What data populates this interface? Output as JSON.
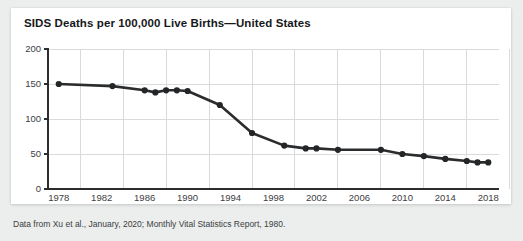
{
  "card": {
    "title": "SIDS Deaths per 100,000 Live Births—United States",
    "footnote": "Data from Xu et al., January, 2020; Monthly Vital Statistics Report, 1980."
  },
  "chart_data": {
    "type": "line",
    "title": "SIDS Deaths per 100,000 Live Births—United States",
    "xlabel": "Year",
    "ylabel": "",
    "xlim": [
      1977,
      2019
    ],
    "ylim": [
      0,
      200
    ],
    "xticks": [
      1978,
      1982,
      1986,
      1990,
      1994,
      1998,
      2002,
      2006,
      2010,
      2014,
      2018
    ],
    "yticks": [
      0,
      50,
      100,
      150,
      200
    ],
    "grid": true,
    "legend": "none",
    "line_color": "#2a2c2e",
    "marker_color": "#232527",
    "x": [
      1978,
      1983,
      1986,
      1987,
      1988,
      1989,
      1990,
      1993,
      1996,
      1999,
      2001,
      2002,
      2004,
      2008,
      2010,
      2012,
      2014,
      2016,
      2017,
      2018
    ],
    "values": [
      150,
      147,
      141,
      138,
      141,
      141,
      140,
      120,
      80,
      62,
      58,
      58,
      56,
      56,
      50,
      47,
      43,
      40,
      38,
      38
    ],
    "series": [
      {
        "name": "SIDS deaths per 100,000 live births",
        "x": [
          1978,
          1983,
          1986,
          1987,
          1988,
          1989,
          1990,
          1993,
          1996,
          1999,
          2001,
          2002,
          2004,
          2008,
          2010,
          2012,
          2014,
          2016,
          2017,
          2018
        ],
        "values": [
          150,
          147,
          141,
          138,
          141,
          141,
          140,
          120,
          80,
          62,
          58,
          58,
          56,
          56,
          50,
          47,
          43,
          40,
          38,
          38
        ]
      }
    ]
  }
}
